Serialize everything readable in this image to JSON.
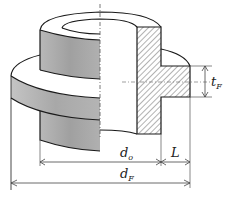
{
  "diagram": {
    "type": "flanged hub cross-section",
    "colors": {
      "background": "#ffffff",
      "outline": "#1a1a1a",
      "shade_dark": "#9a9a9a",
      "shade_light": "#c8c8c8",
      "hatch": "#555555",
      "dim_line": "#444444"
    },
    "labels": {
      "d_o": {
        "main": "d",
        "sub": "o"
      },
      "d_F": {
        "main": "d",
        "sub": "F"
      },
      "L": {
        "main": "L"
      },
      "t_F": {
        "main": "t",
        "sub": "F"
      }
    }
  }
}
